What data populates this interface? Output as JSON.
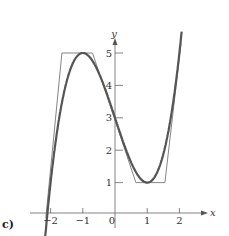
{
  "chart_data": {
    "type": "line",
    "panel_label": "c)",
    "xlabel": "x",
    "ylabel": "y",
    "x_ticks": [
      "−2",
      "−1",
      "0",
      "1",
      "2"
    ],
    "x_tick_values": [
      -2,
      -1,
      0,
      1,
      2
    ],
    "y_ticks": [
      "1",
      "2",
      "3",
      "4",
      "5"
    ],
    "y_tick_values": [
      1,
      2,
      3,
      4,
      5
    ],
    "xlim": [
      -2.5,
      2.9
    ],
    "ylim": [
      -0.3,
      6.0
    ],
    "grid": false,
    "series": [
      {
        "name": "smooth curve",
        "style": "thick",
        "color": "#555555",
        "function": "x^3 - 3x + 3",
        "x": [
          -2.1,
          -2.0,
          -1.75,
          -1.5,
          -1.25,
          -1.0,
          -0.75,
          -0.5,
          -0.25,
          0,
          0.25,
          0.5,
          0.75,
          1.0,
          1.25,
          1.5,
          1.75,
          2.0,
          2.07
        ],
        "y": [
          0.04,
          1.0,
          2.89,
          4.13,
          4.8,
          5.0,
          4.83,
          4.38,
          3.73,
          3.0,
          2.27,
          1.63,
          1.17,
          1.0,
          1.2,
          1.88,
          3.11,
          5.0,
          5.66
        ]
      },
      {
        "name": "piecewise linear approximation",
        "style": "thin",
        "color": "#777777",
        "x": [
          -2.15,
          -1.65,
          -0.7,
          0.65,
          1.55,
          2.05
        ],
        "y": [
          -0.1,
          5.0,
          5.0,
          1.0,
          1.0,
          5.3
        ]
      }
    ]
  }
}
